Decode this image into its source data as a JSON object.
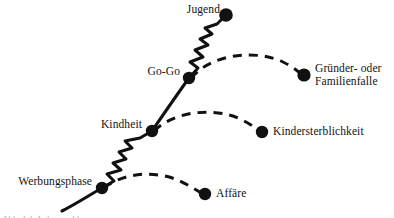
{
  "figure": {
    "type": "diagram",
    "subtype": "lifecycle-curve-with-branch-traps",
    "background_color": "#ffffff",
    "ink_color": "#111111",
    "main_curve_style": "solid-with-zigzag-segments",
    "branch_curve_style": "dashed-arc"
  },
  "nodes": [
    {
      "id": "werbungsphase",
      "label": "Werbungsphase",
      "label_side": "left",
      "x": 102,
      "y": 188,
      "radius": 6.2,
      "on_main_curve": true
    },
    {
      "id": "kindheit",
      "label": "Kindheit",
      "label_side": "left",
      "x": 152,
      "y": 131,
      "radius": 6.2,
      "on_main_curve": true
    },
    {
      "id": "gogo",
      "label": "Go-Go",
      "label_side": "left",
      "x": 189,
      "y": 78,
      "radius": 6.2,
      "on_main_curve": true
    },
    {
      "id": "jugend",
      "label": "Jugend",
      "label_side": "left",
      "x": 226,
      "y": 15,
      "radius": 6.8,
      "on_main_curve": true
    },
    {
      "id": "affaere",
      "label": "Affäre",
      "label_side": "right",
      "x": 205,
      "y": 194,
      "radius": 6.2,
      "on_main_curve": false
    },
    {
      "id": "kindersterblichkeit",
      "label": "Kindersterblichkeit",
      "label_side": "right",
      "x": 262,
      "y": 132,
      "radius": 6.2,
      "on_main_curve": false
    },
    {
      "id": "gruenderfalle",
      "label": "Gründer- oder\nFamilienfalle",
      "label_line_1": "Gründer- oder",
      "label_line_2": "Familienfalle",
      "label_side": "right",
      "x": 304,
      "y": 75,
      "radius": 6.6,
      "on_main_curve": false
    }
  ],
  "labels": {
    "werbungsphase": "Werbungsphase",
    "kindheit": "Kindheit",
    "gogo": "Go-Go",
    "jugend": "Jugend",
    "affaere": "Affäre",
    "kindersterblichkeit": "Kindersterblichkeit",
    "gruenderfalle_line1": "Gründer- oder",
    "gruenderfalle_line2": "Familienfalle"
  },
  "branches": [
    {
      "id": "branch-affaere",
      "from": "werbungsphase",
      "to": "affaere",
      "style": "dashed",
      "peak_label": null
    },
    {
      "id": "branch-kindersterblichkeit",
      "from": "kindheit",
      "to": "kindersterblichkeit",
      "style": "dashed",
      "peak_label": null
    },
    {
      "id": "branch-gruenderfalle",
      "from": "gogo",
      "to": "gruenderfalle",
      "style": "dashed",
      "peak_label": null
    }
  ],
  "caption_sliver": "Abb. 1.1  Lebenszyklus"
}
